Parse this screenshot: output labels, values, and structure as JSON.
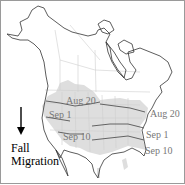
{
  "figure": {
    "title": "Fall Migration",
    "legend": {
      "line1": "Fall",
      "line2": "Migration",
      "arrow_icon": "arrow-down-icon"
    },
    "isochrone_labels": {
      "west": [
        "Aug 20",
        "Sep 1",
        "Sep 10"
      ],
      "east": [
        "Aug 20",
        "Sep 1",
        "Sep 10"
      ]
    },
    "colors": {
      "range_fill": "#dcdcdc",
      "coastline": "#333333",
      "borders": "#c8c8c8",
      "isochrone_line": "#555555",
      "label_text": "#777777"
    }
  }
}
